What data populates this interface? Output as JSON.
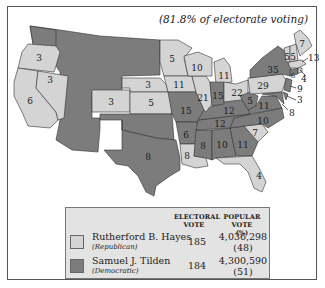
{
  "subtitle": "(81.8% of electorate voting)",
  "colors": {
    "republican": "#d4d4d4",
    "democratic": "#7c7c7c",
    "legend_bg": "#e3e3e3",
    "frame": "#555555"
  },
  "states": [
    {
      "id": "WA",
      "votes": "",
      "party": "democratic"
    },
    {
      "id": "OR",
      "votes": "3",
      "party": "republican"
    },
    {
      "id": "CA",
      "votes": "6",
      "party": "republican"
    },
    {
      "id": "NV",
      "votes": "3",
      "party": "republican"
    },
    {
      "id": "CO",
      "votes": "3",
      "party": "republican"
    },
    {
      "id": "NE",
      "votes": "3",
      "party": "republican"
    },
    {
      "id": "KS",
      "votes": "5",
      "party": "republican"
    },
    {
      "id": "MN",
      "votes": "5",
      "party": "republican"
    },
    {
      "id": "IA",
      "votes": "11",
      "party": "republican"
    },
    {
      "id": "WI",
      "votes": "10",
      "party": "republican"
    },
    {
      "id": "MI",
      "votes": "11",
      "party": "republican"
    },
    {
      "id": "IL",
      "votes": "21",
      "party": "republican"
    },
    {
      "id": "IN",
      "votes": "15",
      "party": "democratic"
    },
    {
      "id": "OH",
      "votes": "22",
      "party": "republican"
    },
    {
      "id": "MO",
      "votes": "15",
      "party": "democratic"
    },
    {
      "id": "TX",
      "votes": "8",
      "party": "democratic"
    },
    {
      "id": "AR",
      "votes": "6",
      "party": "democratic"
    },
    {
      "id": "LA",
      "votes": "8",
      "party": "republican"
    },
    {
      "id": "MS",
      "votes": "8",
      "party": "democratic"
    },
    {
      "id": "AL",
      "votes": "10",
      "party": "democratic"
    },
    {
      "id": "GA",
      "votes": "11",
      "party": "democratic"
    },
    {
      "id": "FL",
      "votes": "4",
      "party": "republican"
    },
    {
      "id": "SC",
      "votes": "7",
      "party": "republican"
    },
    {
      "id": "NC",
      "votes": "10",
      "party": "democratic"
    },
    {
      "id": "TN",
      "votes": "12",
      "party": "democratic"
    },
    {
      "id": "KY",
      "votes": "12",
      "party": "democratic"
    },
    {
      "id": "WV",
      "votes": "5",
      "party": "democratic"
    },
    {
      "id": "VA",
      "votes": "11",
      "party": "democratic"
    },
    {
      "id": "PA",
      "votes": "29",
      "party": "republican"
    },
    {
      "id": "NY",
      "votes": "35",
      "party": "democratic"
    },
    {
      "id": "VT",
      "votes": "5",
      "party": "republican"
    },
    {
      "id": "NH",
      "votes": "5",
      "party": "republican"
    },
    {
      "id": "ME",
      "votes": "7",
      "party": "republican"
    },
    {
      "id": "MA",
      "votes": "13",
      "party": "republican"
    },
    {
      "id": "RI",
      "votes": "4",
      "party": "republican"
    },
    {
      "id": "CT",
      "votes": "6",
      "party": "democratic"
    },
    {
      "id": "NJ",
      "votes": "9",
      "party": "democratic"
    },
    {
      "id": "DE",
      "votes": "3",
      "party": "democratic"
    },
    {
      "id": "MD",
      "votes": "8",
      "party": "democratic"
    }
  ],
  "callouts": {
    "MA": "13",
    "RI": "4",
    "NJ": "9",
    "DE": "3",
    "MD": "8"
  },
  "legend": {
    "col_electoral": "ELECTORAL VOTE",
    "col_electoral_l1": "ELECTORAL",
    "col_electoral_l2": "VOTE",
    "col_popular_l1": "POPULAR VOTE",
    "col_popular_l2": "(%)",
    "rows": [
      {
        "name": "Rutherford B. Hayes",
        "party": "(Republican)",
        "electoral": "185",
        "popular": "4,036,298",
        "percent": "(48)",
        "color": "#d4d4d4"
      },
      {
        "name": "Samuel J. Tilden",
        "party": "(Democratic)",
        "electoral": "184",
        "popular": "4,300,590",
        "percent": "(51)",
        "color": "#7c7c7c"
      }
    ]
  }
}
